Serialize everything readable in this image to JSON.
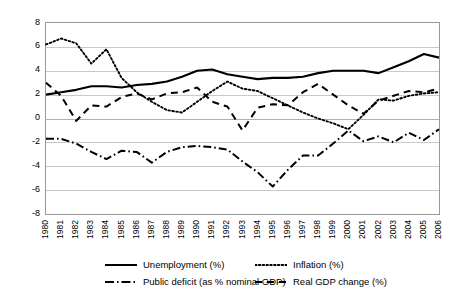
{
  "chart_data": {
    "type": "line",
    "title": "",
    "xlabel": "",
    "ylabel": "",
    "ylim": [
      -8,
      8
    ],
    "y_ticks": [
      8,
      6,
      4,
      2,
      0,
      -2,
      -4,
      -6,
      -8
    ],
    "grid": true,
    "legend_position": "bottom",
    "categories": [
      "1980",
      "1981",
      "1982",
      "1983",
      "1984",
      "1985",
      "1986",
      "1987",
      "1988",
      "1989",
      "1990",
      "1991",
      "1992",
      "1993",
      "1994",
      "1995",
      "1996",
      "1997",
      "1998",
      "1999",
      "2000",
      "2001",
      "2002",
      "2003",
      "2004",
      "2005",
      "2006"
    ],
    "series": [
      {
        "name": "Unemployment (%)",
        "style": "solid",
        "color": "#000000",
        "values": [
          2.0,
          2.2,
          2.4,
          2.7,
          2.7,
          2.6,
          2.8,
          2.9,
          3.1,
          3.5,
          4.0,
          4.1,
          3.7,
          3.5,
          3.3,
          3.4,
          3.4,
          3.5,
          3.8,
          4.0,
          4.0,
          4.0,
          3.8,
          4.3,
          4.8,
          5.4,
          5.1
        ]
      },
      {
        "name": "Inflation (%)",
        "style": "dotted",
        "color": "#000000",
        "values": [
          6.2,
          6.7,
          6.3,
          4.6,
          5.8,
          3.4,
          2.2,
          1.4,
          0.7,
          0.5,
          1.4,
          2.3,
          3.1,
          2.5,
          2.3,
          1.7,
          1.1,
          0.5,
          0.0,
          -0.4,
          -0.9,
          0.3,
          1.6,
          1.5,
          1.9,
          2.1,
          2.2
        ]
      },
      {
        "name": "Public deficit (as % nominal GDP)",
        "style": "dashdot",
        "color": "#000000",
        "values": [
          -1.7,
          -1.7,
          -2.1,
          -2.8,
          -3.4,
          -2.7,
          -2.8,
          -3.7,
          -2.8,
          -2.4,
          -2.3,
          -2.4,
          -2.6,
          -3.6,
          -4.5,
          -5.7,
          -4.3,
          -3.1,
          -3.1,
          -2.1,
          -1.0,
          -1.9,
          -1.5,
          -2.0,
          -1.2,
          -1.8,
          -0.9
        ]
      },
      {
        "name": "Real GDP change (%)",
        "style": "dashed",
        "color": "#000000",
        "values": [
          3.0,
          1.9,
          -0.2,
          1.1,
          1.0,
          1.8,
          2.1,
          1.6,
          2.1,
          2.2,
          2.6,
          1.4,
          1.0,
          -1.0,
          0.9,
          1.2,
          1.1,
          2.2,
          2.9,
          2.0,
          1.1,
          0.4,
          1.5,
          1.9,
          2.3,
          2.2,
          2.5
        ]
      }
    ]
  },
  "axis": {
    "y_labels": [
      "8",
      "6",
      "4",
      "2",
      "0",
      "-2",
      "-4",
      "-6",
      "-8"
    ],
    "x_labels": [
      "1980",
      "1981",
      "1982",
      "1983",
      "1984",
      "1985",
      "1986",
      "1987",
      "1988",
      "1989",
      "1990",
      "1991",
      "1992",
      "1993",
      "1994",
      "1995",
      "1996",
      "1997",
      "1998",
      "1999",
      "2000",
      "2001",
      "2002",
      "2003",
      "2004",
      "2005",
      "2006"
    ]
  },
  "legend": {
    "unemployment": "Unemployment (%)",
    "inflation": "Inflation (%)",
    "deficit": "Public deficit (as % nominal GDP)",
    "gdp": "Real GDP change (%)"
  }
}
